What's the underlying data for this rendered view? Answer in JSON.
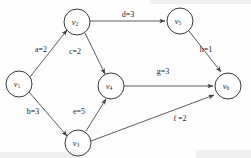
{
  "diagram": {
    "type": "directed-weighted-graph",
    "background_color": "#fdfdfd",
    "node_stroke_color": "#3a3a3a",
    "edge_stroke_color": "#4a4a4a",
    "label_color": "#242424"
  },
  "nodes": [
    {
      "id": "v1",
      "base": "v",
      "sub": "1",
      "cx": 19,
      "cy": 84,
      "r": 13
    },
    {
      "id": "v2",
      "base": "v",
      "sub": "2",
      "cx": 77,
      "cy": 22,
      "r": 13
    },
    {
      "id": "v3",
      "base": "v",
      "sub": "3",
      "cx": 78,
      "cy": 143,
      "r": 13
    },
    {
      "id": "v4",
      "base": "v",
      "sub": "4",
      "cx": 111,
      "cy": 86,
      "r": 13
    },
    {
      "id": "v5",
      "base": "v",
      "sub": "5",
      "cx": 180,
      "cy": 21,
      "r": 13
    },
    {
      "id": "v6",
      "base": "v",
      "sub": "6",
      "cx": 228,
      "cy": 86,
      "r": 13
    }
  ],
  "edges": [
    {
      "id": "a",
      "from": "v1",
      "to": "v2",
      "letter": "a",
      "weight": "2",
      "label": "a=2",
      "label_x": 41,
      "label_y": 50
    },
    {
      "id": "b",
      "from": "v1",
      "to": "v3",
      "letter": "b",
      "weight": "3",
      "label": "b=3",
      "label_x": 33,
      "label_y": 112
    },
    {
      "id": "c",
      "from": "v2",
      "to": "v4",
      "letter": "c",
      "weight": "2",
      "label": "c=2",
      "label_x": 75,
      "label_y": 52
    },
    {
      "id": "d",
      "from": "v2",
      "to": "v5",
      "letter": "d",
      "weight": "3",
      "label": "d=3",
      "label_x": 128,
      "label_y": 15
    },
    {
      "id": "e",
      "from": "v3",
      "to": "v4",
      "letter": "e",
      "weight": "5",
      "label": "e=5",
      "label_x": 79,
      "label_y": 112
    },
    {
      "id": "f",
      "from": "v3",
      "to": "v6",
      "letter": "f",
      "weight": "2",
      "label": "f =2",
      "label_x": 180,
      "label_y": 119
    },
    {
      "id": "g",
      "from": "v4",
      "to": "v6",
      "letter": "g",
      "weight": "3",
      "label": "g=3",
      "label_x": 163,
      "label_y": 72
    },
    {
      "id": "h",
      "from": "v5",
      "to": "v6",
      "letter": "h",
      "weight": "1",
      "label": "h=1",
      "label_x": 206,
      "label_y": 50
    }
  ]
}
